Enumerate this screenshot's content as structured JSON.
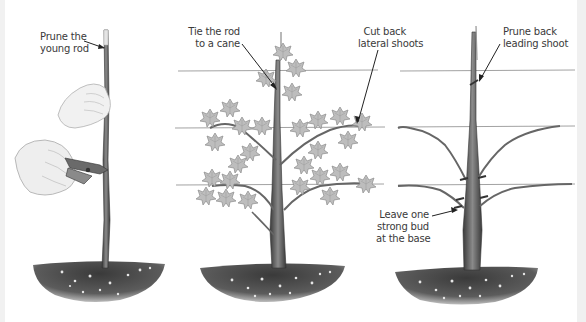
{
  "figure": {
    "type": "pruning-steps-illustration",
    "panels": [
      {
        "id": "panel-1",
        "labels": [
          {
            "line1": "Prune the",
            "line2": "young rod"
          }
        ]
      },
      {
        "id": "panel-2",
        "labels": [
          {
            "line1": "Tie the rod",
            "line2": "to a cane"
          },
          {
            "line1": "Cut back",
            "line2": "lateral shoots"
          }
        ]
      },
      {
        "id": "panel-3",
        "labels": [
          {
            "line1": "Prune back",
            "line2": "leading shoot"
          },
          {
            "line1": "Leave one",
            "line2": "strong bud",
            "line3": "at the base"
          }
        ]
      }
    ],
    "colors": {
      "text": "#3a3a3a",
      "wire": "#8a8a8a",
      "stem": "#4a4a4a",
      "leaf": "#b8b8b8",
      "soil": "#3e3e3e"
    }
  }
}
